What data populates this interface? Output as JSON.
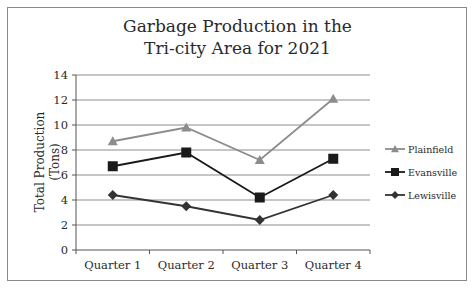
{
  "chart_data": {
    "type": "line",
    "title": "Garbage Production in the Tri-city Area for 2021",
    "title_lines": [
      "Garbage Production in the",
      "Tri-city Area for 2021"
    ],
    "xlabel": "",
    "ylabel": "Total Production (Tons)",
    "ylabel_lines": [
      "Total Production",
      "(Tons)"
    ],
    "categories": [
      "Quarter 1",
      "Quarter 2",
      "Quarter 3",
      "Quarter 4"
    ],
    "ylim": [
      0,
      14
    ],
    "yticks": [
      0,
      2,
      4,
      6,
      8,
      10,
      12,
      14
    ],
    "grid": true,
    "legend_position": "right",
    "series": [
      {
        "name": "Plainfield",
        "marker": "triangle",
        "color": "#8c8c8c",
        "values": [
          8.7,
          9.8,
          7.2,
          12.1
        ]
      },
      {
        "name": "Evansville",
        "marker": "square",
        "color": "#1a1a1a",
        "values": [
          6.7,
          7.8,
          4.2,
          7.3
        ]
      },
      {
        "name": "Lewisville",
        "marker": "diamond",
        "color": "#333333",
        "values": [
          4.4,
          3.5,
          2.4,
          4.4
        ]
      }
    ]
  }
}
